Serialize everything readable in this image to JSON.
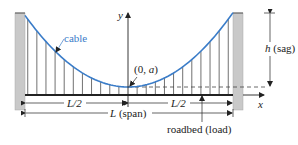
{
  "diagram": {
    "labels": {
      "cable": "cable",
      "vertex": "(0, a)",
      "vertex_italic_part": "a",
      "y_axis": "y",
      "x_axis": "x",
      "sag": "h (sag)",
      "sag_var": "h",
      "sag_word": " (sag)",
      "half_span_left": "L/2",
      "half_span_right": "L/2",
      "span_var": "L",
      "span_word": " (span)",
      "roadbed": "roadbed (load)"
    },
    "colors": {
      "cable": "#3a7cc8",
      "pillar": "#c9c9c9",
      "line": "#222222"
    },
    "hanger_count_per_side": 11
  }
}
